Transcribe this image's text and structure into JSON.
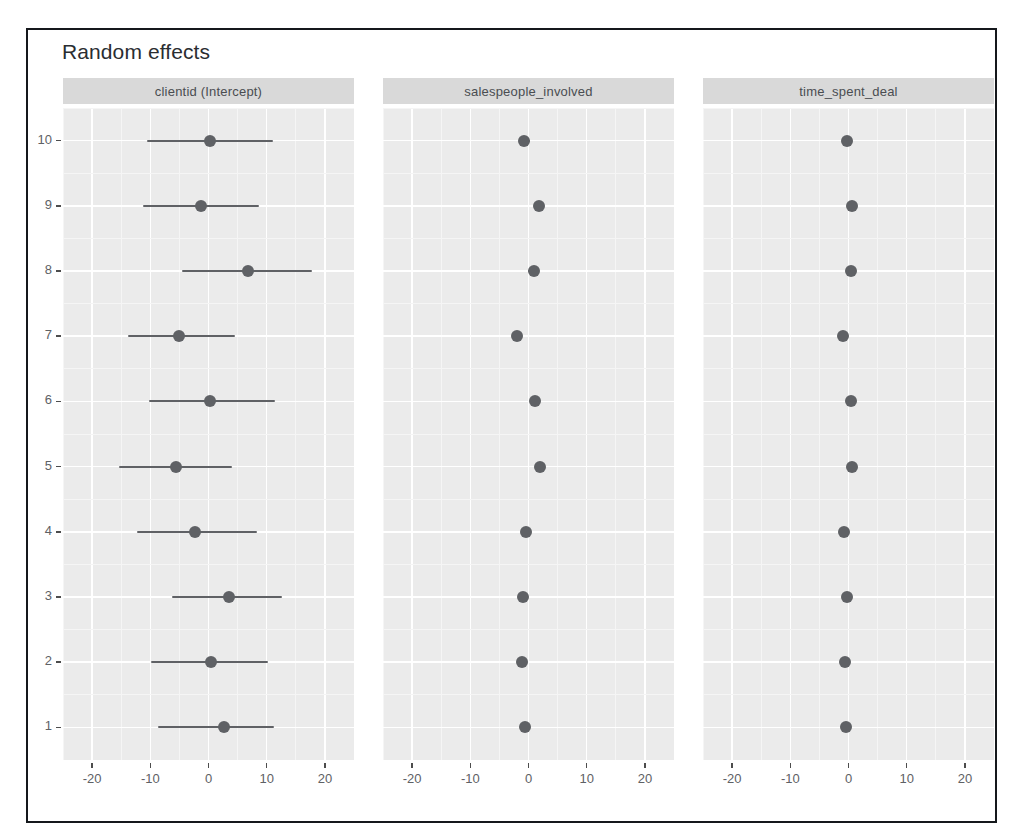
{
  "plot": {
    "title": "Random effects",
    "frame_color": "#15181c",
    "panel_bg": "#ebebeb",
    "strip_bg": "#d9d9d9",
    "point_color": "#5f6165",
    "grid_color": "#ffffff"
  },
  "chart_data": {
    "type": "scatter",
    "title": "Random effects",
    "subtitle": "",
    "xlabel": "",
    "ylabel": "",
    "grid": true,
    "legend": "none",
    "xlim": [
      -25,
      25
    ],
    "xticks": [
      -20,
      -10,
      0,
      10,
      20
    ],
    "xtick_labels": [
      "-20",
      "-10",
      "0",
      "10",
      "20"
    ],
    "yticks": [
      1,
      2,
      3,
      4,
      5,
      6,
      7,
      8,
      9,
      10
    ],
    "ytick_labels": [
      "1",
      "2",
      "3",
      "4",
      "5",
      "6",
      "7",
      "8",
      "9",
      "10"
    ],
    "y_category_name": "clientid",
    "facet_labels": [
      "clientid (Intercept)",
      "salespeople_involved",
      "time_spent_deal"
    ],
    "panels": [
      {
        "label": "clientid (Intercept)",
        "series": [
          {
            "name": "clientid (Intercept)",
            "categories": [
              10,
              9,
              8,
              7,
              6,
              5,
              4,
              3,
              2,
              1
            ],
            "values": [
              0.3,
              -1.3,
              6.8,
              -5.0,
              0.2,
              -5.5,
              -2.3,
              3.6,
              0.4,
              2.7
            ],
            "ci_low": [
              -10.5,
              -11.2,
              -4.5,
              -13.8,
              -10.2,
              -15.3,
              -12.2,
              -6.2,
              -9.8,
              -8.7
            ],
            "ci_high": [
              11.0,
              8.6,
              17.8,
              4.6,
              11.5,
              4.0,
              8.3,
              12.6,
              10.2,
              11.2
            ]
          }
        ]
      },
      {
        "label": "salespeople_involved",
        "series": [
          {
            "name": "salespeople_involved",
            "categories": [
              10,
              9,
              8,
              7,
              6,
              5,
              4,
              3,
              2,
              1
            ],
            "values": [
              -0.7,
              1.8,
              0.9,
              -2.0,
              1.1,
              2.0,
              -0.5,
              -0.9,
              -1.1,
              -0.6
            ],
            "ci_low": [
              -1.5,
              1.1,
              -0.1,
              -2.8,
              0.4,
              1.3,
              -1.3,
              -1.8,
              -1.9,
              -1.4
            ],
            "ci_high": [
              0.2,
              2.6,
              1.8,
              -1.2,
              1.9,
              2.8,
              0.4,
              -0.1,
              -0.3,
              0.2
            ]
          }
        ]
      },
      {
        "label": "time_spent_deal",
        "series": [
          {
            "name": "time_spent_deal",
            "categories": [
              10,
              9,
              8,
              7,
              6,
              5,
              4,
              3,
              2,
              1
            ],
            "values": [
              -0.2,
              0.6,
              0.4,
              -1.0,
              0.4,
              0.6,
              -0.8,
              -0.2,
              -0.6,
              -0.4
            ],
            "ci_low": [
              -0.35,
              0.45,
              0.25,
              -1.15,
              0.25,
              0.45,
              -0.95,
              -0.35,
              -0.75,
              -0.55
            ],
            "ci_high": [
              -0.05,
              0.75,
              0.55,
              -0.85,
              0.55,
              0.75,
              -0.65,
              -0.05,
              -0.45,
              -0.25
            ]
          }
        ]
      }
    ]
  }
}
